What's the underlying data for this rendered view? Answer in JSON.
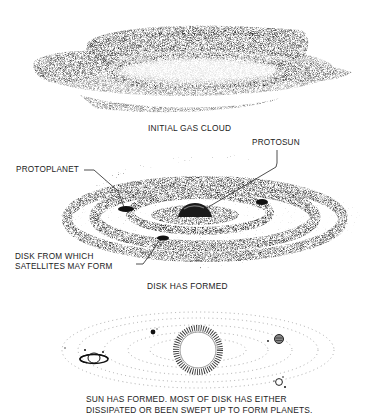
{
  "figure": {
    "stages": [
      {
        "id": "stage-1",
        "caption": "INITIAL GAS CLOUD",
        "labels": []
      },
      {
        "id": "stage-2",
        "caption": "DISK HAS FORMED",
        "labels": [
          {
            "text": "PROTOSUN"
          },
          {
            "text": "PROTOPLANET"
          },
          {
            "text_line1": "DISK FROM WHICH",
            "text_line2": "SATELLITES MAY FORM"
          }
        ]
      },
      {
        "id": "stage-3",
        "caption_line1": "SUN HAS FORMED.  MOST OF DISK HAS EITHER",
        "caption_line2": "DISSIPATED OR BEEN SWEPT UP TO FORM PLANETS."
      }
    ],
    "icons": [
      "gas-cloud-illustration",
      "protoplanetary-disk-illustration",
      "solar-system-illustration",
      "sun-icon",
      "ringed-planet-icon",
      "planet-icon"
    ]
  }
}
